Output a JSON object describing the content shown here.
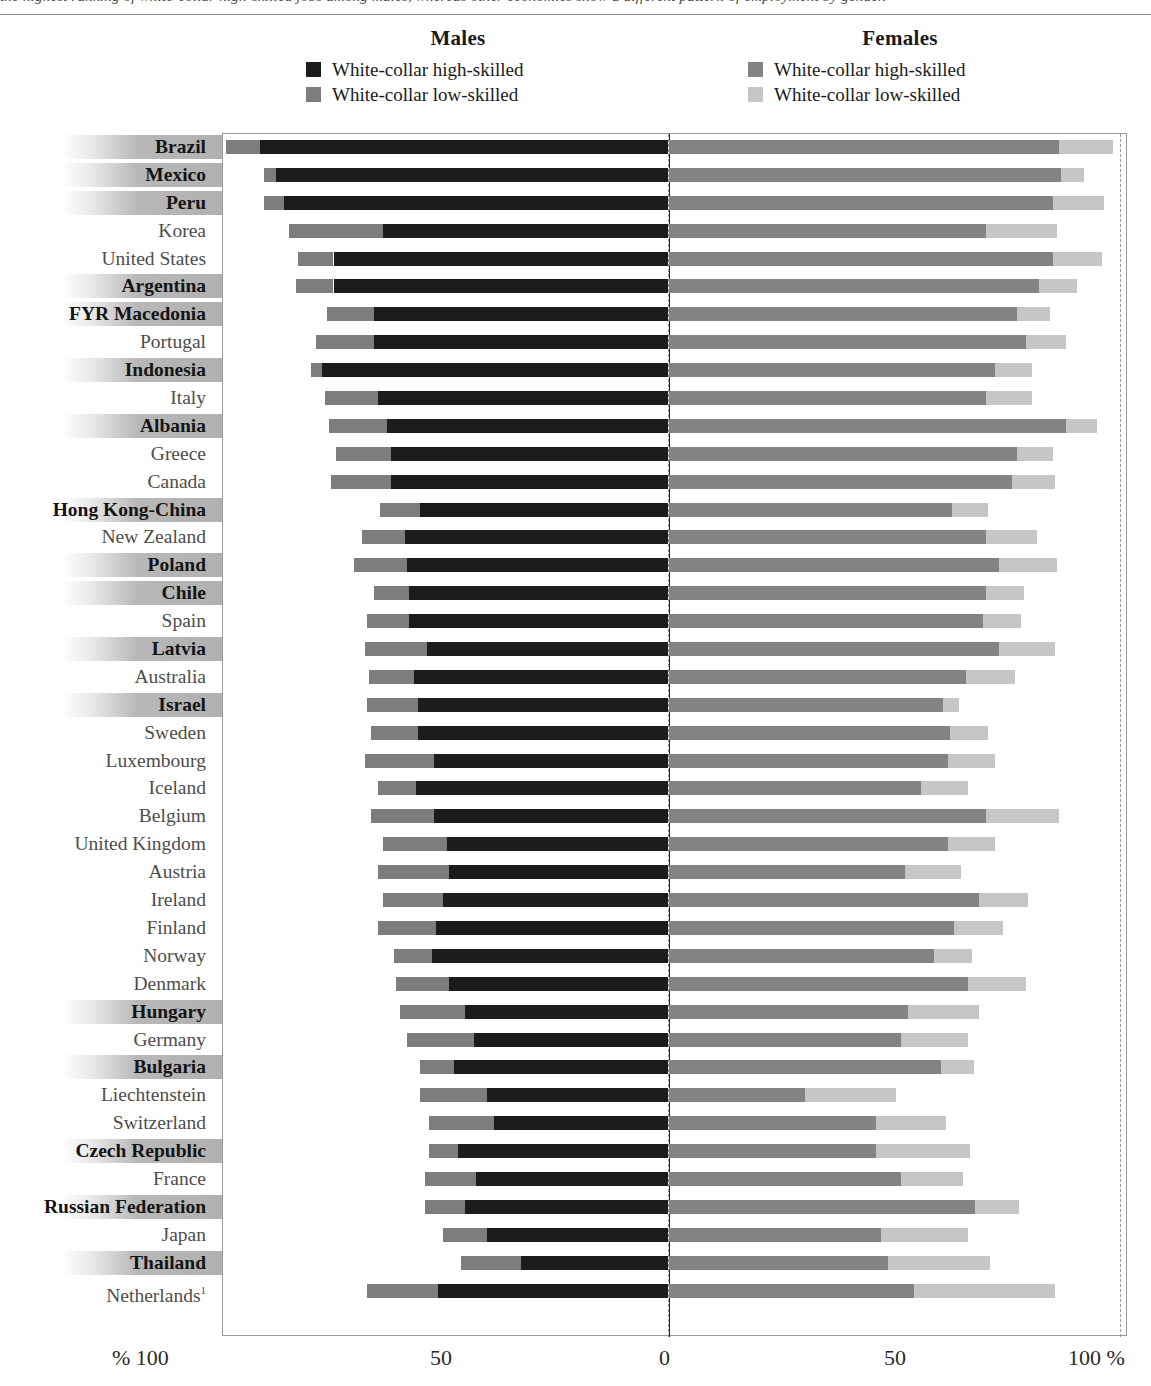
{
  "top_cut_text": "the highest ranking of white-collar high-skilled jobs among males, whereas other economies show a different pattern of employment by gender.",
  "legend": {
    "males": {
      "title": "Males",
      "items": [
        {
          "label": "White-collar high-skilled",
          "color": "#1c1c1c",
          "name": "males-high-skilled"
        },
        {
          "label": "White-collar low-skilled",
          "color": "#7d7d7d",
          "name": "males-low-skilled"
        }
      ]
    },
    "females": {
      "title": "Females",
      "items": [
        {
          "label": "White-collar high-skilled",
          "color": "#838383",
          "name": "females-high-skilled"
        },
        {
          "label": "White-collar low-skilled",
          "color": "#c6c6c6",
          "name": "females-low-skilled"
        }
      ]
    }
  },
  "axis": {
    "ticks": [
      {
        "id": "xlab-l100",
        "text": "% 100"
      },
      {
        "id": "xlab-l50",
        "text": "50"
      },
      {
        "id": "xlab-0",
        "text": "0"
      },
      {
        "id": "xlab-r50",
        "text": "50"
      },
      {
        "id": "xlab-r100",
        "text": "100 %"
      }
    ]
  },
  "chart_data": {
    "type": "bar",
    "subtype": "diverging-stacked-bar",
    "title": "Males",
    "title2": "Females",
    "xlabel": "%",
    "ylabel": "",
    "xlim": [
      -100,
      100
    ],
    "grid": false,
    "gridlines": [
      -50,
      50
    ],
    "legend_position": "top",
    "series": [
      {
        "name": "Males White-collar high-skilled",
        "color": "#1c1c1c",
        "side": "left"
      },
      {
        "name": "Males White-collar low-skilled",
        "color": "#7d7d7d",
        "side": "left"
      },
      {
        "name": "Females White-collar high-skilled",
        "color": "#838383",
        "side": "right"
      },
      {
        "name": "Females White-collar low-skilled",
        "color": "#c6c6c6",
        "side": "right"
      }
    ],
    "categories": [
      "Brazil",
      "Mexico",
      "Peru",
      "Korea",
      "United States",
      "Argentina",
      "FYR Macedonia",
      "Portugal",
      "Indonesia",
      "Italy",
      "Albania",
      "Greece",
      "Canada",
      "Hong Kong-China",
      "New Zealand",
      "Poland",
      "Chile",
      "Spain",
      "Latvia",
      "Australia",
      "Israel",
      "Sweden",
      "Luxembourg",
      "Iceland",
      "Belgium",
      "United Kingdom",
      "Austria",
      "Ireland",
      "Finland",
      "Norway",
      "Denmark",
      "Hungary",
      "Germany",
      "Bulgaria",
      "Liechtenstein",
      "Switzerland",
      "Czech Republic",
      "France",
      "Russian Federation",
      "Japan",
      "Thailand",
      "Netherlands"
    ],
    "rows": [
      {
        "country": "Brazil",
        "shaded": true,
        "m_high": 91.5,
        "m_low": 7.5,
        "f_high": 87.5,
        "f_low": 12.0
      },
      {
        "country": "Mexico",
        "shaded": true,
        "m_high": 88.0,
        "m_low": 2.5,
        "f_high": 88.0,
        "f_low": 5.0
      },
      {
        "country": "Peru",
        "shaded": true,
        "m_high": 86.0,
        "m_low": 4.5,
        "f_high": 86.0,
        "f_low": 11.5
      },
      {
        "country": "Korea",
        "shaded": false,
        "m_high": 64.0,
        "m_low": 21.0,
        "f_high": 71.0,
        "f_low": 16.0
      },
      {
        "country": "United States",
        "shaded": false,
        "m_high": 75.0,
        "m_low": 8.0,
        "f_high": 86.0,
        "f_low": 11.0
      },
      {
        "country": "Argentina",
        "shaded": true,
        "m_high": 75.0,
        "m_low": 8.5,
        "f_high": 83.0,
        "f_low": 8.5
      },
      {
        "country": "FYR Macedonia",
        "shaded": true,
        "m_high": 66.0,
        "m_low": 10.5,
        "f_high": 78.0,
        "f_low": 7.5
      },
      {
        "country": "Portugal",
        "shaded": false,
        "m_high": 66.0,
        "m_low": 13.0,
        "f_high": 80.0,
        "f_low": 9.0
      },
      {
        "country": "Indonesia",
        "shaded": true,
        "m_high": 77.5,
        "m_low": 2.5,
        "f_high": 73.0,
        "f_low": 8.5
      },
      {
        "country": "Italy",
        "shaded": false,
        "m_high": 65.0,
        "m_low": 12.0,
        "f_high": 71.0,
        "f_low": 10.5
      },
      {
        "country": "Albania",
        "shaded": true,
        "m_high": 63.0,
        "m_low": 13.0,
        "f_high": 89.0,
        "f_low": 7.0
      },
      {
        "country": "Greece",
        "shaded": false,
        "m_high": 62.0,
        "m_low": 12.5,
        "f_high": 78.0,
        "f_low": 8.0
      },
      {
        "country": "Canada",
        "shaded": false,
        "m_high": 62.0,
        "m_low": 13.5,
        "f_high": 77.0,
        "f_low": 9.5
      },
      {
        "country": "Hong Kong-China",
        "shaded": true,
        "m_high": 55.5,
        "m_low": 9.0,
        "f_high": 63.5,
        "f_low": 8.0
      },
      {
        "country": "New Zealand",
        "shaded": false,
        "m_high": 59.0,
        "m_low": 9.5,
        "f_high": 71.0,
        "f_low": 11.5
      },
      {
        "country": "Poland",
        "shaded": true,
        "m_high": 58.5,
        "m_low": 12.0,
        "f_high": 74.0,
        "f_low": 13.0
      },
      {
        "country": "Chile",
        "shaded": true,
        "m_high": 58.0,
        "m_low": 8.0,
        "f_high": 71.0,
        "f_low": 8.5
      },
      {
        "country": "Spain",
        "shaded": false,
        "m_high": 58.0,
        "m_low": 9.5,
        "f_high": 70.5,
        "f_low": 8.5
      },
      {
        "country": "Latvia",
        "shaded": true,
        "m_high": 54.0,
        "m_low": 14.0,
        "f_high": 74.0,
        "f_low": 12.5
      },
      {
        "country": "Australia",
        "shaded": false,
        "m_high": 57.0,
        "m_low": 10.0,
        "f_high": 66.5,
        "f_low": 11.0
      },
      {
        "country": "Israel",
        "shaded": true,
        "m_high": 56.0,
        "m_low": 11.5,
        "f_high": 61.5,
        "f_low": 3.5
      },
      {
        "country": "Sweden",
        "shaded": false,
        "m_high": 56.0,
        "m_low": 10.5,
        "f_high": 63.0,
        "f_low": 8.5
      },
      {
        "country": "Luxembourg",
        "shaded": false,
        "m_high": 52.5,
        "m_low": 15.5,
        "f_high": 62.5,
        "f_low": 10.5
      },
      {
        "country": "Iceland",
        "shaded": false,
        "m_high": 56.5,
        "m_low": 8.5,
        "f_high": 56.5,
        "f_low": 10.5
      },
      {
        "country": "Belgium",
        "shaded": false,
        "m_high": 52.5,
        "m_low": 14.0,
        "f_high": 71.0,
        "f_low": 16.5
      },
      {
        "country": "United Kingdom",
        "shaded": false,
        "m_high": 49.5,
        "m_low": 14.5,
        "f_high": 62.5,
        "f_low": 10.5
      },
      {
        "country": "Austria",
        "shaded": false,
        "m_high": 49.0,
        "m_low": 16.0,
        "f_high": 53.0,
        "f_low": 12.5
      },
      {
        "country": "Ireland",
        "shaded": false,
        "m_high": 50.5,
        "m_low": 13.5,
        "f_high": 69.5,
        "f_low": 11.0
      },
      {
        "country": "Finland",
        "shaded": false,
        "m_high": 52.0,
        "m_low": 13.0,
        "f_high": 64.0,
        "f_low": 11.0
      },
      {
        "country": "Norway",
        "shaded": false,
        "m_high": 53.0,
        "m_low": 8.5,
        "f_high": 59.5,
        "f_low": 8.5
      },
      {
        "country": "Denmark",
        "shaded": false,
        "m_high": 49.0,
        "m_low": 12.0,
        "f_high": 67.0,
        "f_low": 13.0
      },
      {
        "country": "Hungary",
        "shaded": true,
        "m_high": 45.5,
        "m_low": 14.5,
        "f_high": 53.5,
        "f_low": 16.0
      },
      {
        "country": "Germany",
        "shaded": false,
        "m_high": 43.5,
        "m_low": 15.0,
        "f_high": 52.0,
        "f_low": 15.0
      },
      {
        "country": "Bulgaria",
        "shaded": true,
        "m_high": 48.0,
        "m_low": 7.5,
        "f_high": 61.0,
        "f_low": 7.5
      },
      {
        "country": "Liechtenstein",
        "shaded": false,
        "m_high": 40.5,
        "m_low": 15.0,
        "f_high": 30.5,
        "f_low": 20.5
      },
      {
        "country": "Switzerland",
        "shaded": false,
        "m_high": 39.0,
        "m_low": 14.5,
        "f_high": 46.5,
        "f_low": 15.5
      },
      {
        "country": "Czech Republic",
        "shaded": true,
        "m_high": 47.0,
        "m_low": 6.5,
        "f_high": 46.5,
        "f_low": 21.0
      },
      {
        "country": "France",
        "shaded": false,
        "m_high": 43.0,
        "m_low": 11.5,
        "f_high": 52.0,
        "f_low": 14.0
      },
      {
        "country": "Russian Federation",
        "shaded": true,
        "m_high": 45.5,
        "m_low": 9.0,
        "f_high": 68.5,
        "f_low": 10.0
      },
      {
        "country": "Japan",
        "shaded": false,
        "m_high": 40.5,
        "m_low": 10.0,
        "f_high": 47.5,
        "f_low": 19.5
      },
      {
        "country": "Thailand",
        "shaded": true,
        "m_high": 33.0,
        "m_low": 13.5,
        "f_high": 49.0,
        "f_low": 23.0
      },
      {
        "country": "Netherlands",
        "shaded": false,
        "superscript": "1",
        "m_high": 51.5,
        "m_low": 16.0,
        "f_high": 55.0,
        "f_low": 31.5
      }
    ]
  }
}
